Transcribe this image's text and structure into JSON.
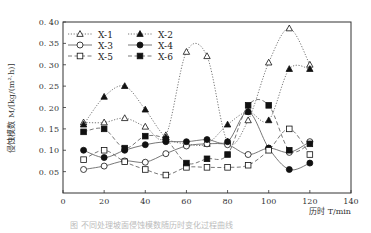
{
  "chart_data": {
    "type": "line",
    "title": "",
    "xlabel": "历时 T/min",
    "ylabel": "侵蚀模数 M/[kg/(m²·h)]",
    "xlim": [
      0,
      140
    ],
    "ylim": [
      0,
      0.4
    ],
    "x_ticks": [
      0,
      20,
      40,
      60,
      80,
      100,
      120,
      140
    ],
    "y_ticks": [
      0.05,
      0.1,
      0.15,
      0.2,
      0.25,
      0.3,
      0.35,
      0.4
    ],
    "y_tick_labels": [
      "0. 05",
      "0. 10",
      "0. 15",
      "0. 20",
      "0. 25",
      "0. 30",
      "0. 35",
      "0. 40"
    ],
    "grid": false,
    "legend_position": "upper-left-inside",
    "x": [
      10,
      20,
      30,
      40,
      50,
      60,
      70,
      80,
      90,
      100,
      110,
      120
    ],
    "series": [
      {
        "name": "X-1",
        "marker": "triangle-open",
        "line": "dotted",
        "values": [
          0.165,
          0.165,
          0.175,
          0.155,
          0.135,
          0.33,
          0.32,
          0.12,
          0.17,
          0.305,
          0.385,
          0.3
        ]
      },
      {
        "name": "X-2",
        "marker": "triangle-filled",
        "line": "dotted",
        "values": [
          0.16,
          0.225,
          0.25,
          0.195,
          0.13,
          0.115,
          0.115,
          0.16,
          0.19,
          0.17,
          0.29,
          0.29
        ]
      },
      {
        "name": "X-3",
        "marker": "circle-open",
        "line": "solid",
        "values": [
          0.055,
          0.063,
          0.075,
          0.072,
          0.092,
          0.11,
          0.115,
          0.113,
          0.09,
          0.105,
          0.095,
          0.12
        ]
      },
      {
        "name": "X-4",
        "marker": "circle-filled",
        "line": "solid",
        "values": [
          0.1,
          0.083,
          0.1,
          0.113,
          0.12,
          0.12,
          0.125,
          0.12,
          0.19,
          0.105,
          0.055,
          0.07
        ]
      },
      {
        "name": "X-5",
        "marker": "square-open",
        "line": "dashed",
        "values": [
          0.078,
          0.1,
          0.073,
          0.055,
          0.042,
          0.06,
          0.06,
          0.06,
          0.065,
          0.1,
          0.15,
          0.09
        ]
      },
      {
        "name": "X-6",
        "marker": "square-filled",
        "line": "dashed",
        "values": [
          0.143,
          0.15,
          0.105,
          0.133,
          0.125,
          0.07,
          0.08,
          0.09,
          0.205,
          0.205,
          0.1,
          0.115
        ]
      }
    ]
  },
  "caption": "图 不同处理坡面侵蚀模数随历时变化过程曲线",
  "colors": {
    "line": "#555555",
    "axis": "#333333",
    "marker": "#111111"
  }
}
